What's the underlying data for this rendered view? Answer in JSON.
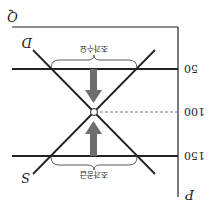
{
  "diagram": {
    "type": "supply-demand",
    "orientation": "rotated-180",
    "axes": {
      "y_label": "P",
      "x_label": "Q"
    },
    "price_levels": [
      {
        "value": "150",
        "style": "solid"
      },
      {
        "value": "100",
        "style": "dashed"
      },
      {
        "value": "50",
        "style": "solid"
      }
    ],
    "curves": {
      "demand_label": "D",
      "supply_label": "S"
    },
    "annotations": {
      "excess_supply": "초과공급",
      "excess_demand": "초과수요"
    },
    "equilibrium_price": "100",
    "colors": {
      "line": "#222222",
      "arrow": "#6e6e6e",
      "background": "#ffffff"
    }
  }
}
